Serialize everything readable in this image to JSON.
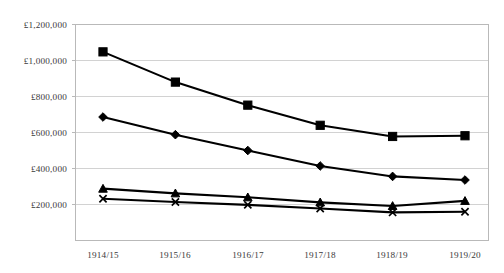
{
  "chart_data": {
    "type": "line",
    "title": "",
    "subtitle": "",
    "xlabel": "",
    "ylabel": "",
    "categories": [
      "1914/15",
      "1915/16",
      "1916/17",
      "1917/18",
      "1918/19",
      "1919/20"
    ],
    "ylim": [
      0,
      1200000
    ],
    "ytick_values": [
      0,
      200000,
      400000,
      600000,
      800000,
      1000000,
      1200000
    ],
    "ytick_labels": [
      "",
      "£200,000",
      "£400,000",
      "£600,000",
      "£800,000",
      "£1,000,000",
      "£1,200,000"
    ],
    "grid": true,
    "legend": "none",
    "series": [
      {
        "name": "series-1",
        "marker": "square",
        "color": "#000000",
        "values": [
          1048000,
          880000,
          752000,
          640000,
          578000,
          582000
        ]
      },
      {
        "name": "series-2",
        "marker": "diamond",
        "color": "#000000",
        "values": [
          686000,
          588000,
          500000,
          414000,
          356000,
          336000
        ]
      },
      {
        "name": "series-3",
        "marker": "triangle",
        "color": "#000000",
        "values": [
          288000,
          262000,
          240000,
          212000,
          192000,
          220000
        ]
      },
      {
        "name": "series-4",
        "marker": "x",
        "color": "#000000",
        "values": [
          232000,
          214000,
          198000,
          178000,
          156000,
          160000
        ]
      }
    ]
  },
  "axis": {
    "y_labels": [
      "£1,200,000",
      "£1,000,000",
      "£800,000",
      "£600,000",
      "£400,000",
      "£200,000"
    ],
    "x_labels": [
      "1914/15",
      "1915/16",
      "1916/17",
      "1917/18",
      "1918/19",
      "1919/20"
    ]
  },
  "colors": {
    "background": "#ffffff",
    "gridline": "#d2d2d2",
    "border": "#b9b9b9",
    "series": "#000000",
    "text": "#3a3a3a"
  }
}
